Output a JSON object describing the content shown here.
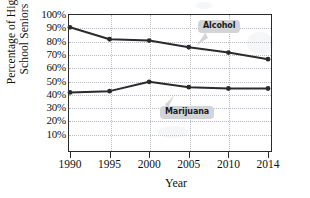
{
  "chart_data": {
    "type": "line",
    "title": "",
    "xlabel": "Year",
    "ylabel": "Percentage of High School Seniors",
    "ylabel_line1": "Percentage of High",
    "ylabel_line2": "School Seniors",
    "categories": [
      "1990",
      "1995",
      "2000",
      "2005",
      "2010",
      "2014"
    ],
    "x": [
      1990,
      1995,
      2000,
      2005,
      2010,
      2014
    ],
    "ylim": [
      0,
      100
    ],
    "yticks": [
      100,
      90,
      80,
      70,
      60,
      50,
      40,
      30,
      20,
      10
    ],
    "ytick_labels": [
      "100%",
      "90%",
      "80%",
      "70%",
      "60%",
      "50%",
      "40%",
      "30%",
      "20%",
      "10%"
    ],
    "grid": true,
    "legend_position": "inline-callouts",
    "series": [
      {
        "name": "Alcohol",
        "label": "Alcohol",
        "color": "#2b2b2b",
        "values": [
          90,
          81,
          80,
          75,
          71,
          66
        ]
      },
      {
        "name": "Marijuana",
        "label": "Marijuana",
        "color": "#2b2b2b",
        "values": [
          41,
          42,
          49,
          45,
          44,
          44
        ]
      }
    ]
  },
  "axes": {
    "y_title_line1": "Percentage of High",
    "y_title_line2": "School Seniors",
    "x_title": "Year"
  },
  "colors": {
    "line": "#2b2b2b",
    "grid": "#b9bcc2",
    "frame": "#2b2b2b",
    "callout_bg": "#d2d4d8",
    "text": "#111111"
  }
}
